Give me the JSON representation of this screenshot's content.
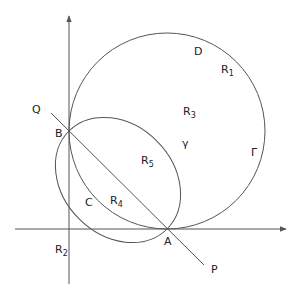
{
  "diagram": {
    "colors": {
      "stroke": "#555555",
      "text": "#222222",
      "background": "#ffffff"
    },
    "points": {
      "A": "A",
      "B": "B",
      "C": "C",
      "D": "D",
      "P": "P",
      "Q": "Q"
    },
    "curves": {
      "big_circle": "Γ",
      "inner_curve": "γ"
    },
    "regions": {
      "R1": {
        "base": "R",
        "sub": "1"
      },
      "R2": {
        "base": "R",
        "sub": "2"
      },
      "R3": {
        "base": "R",
        "sub": "3"
      },
      "R4": {
        "base": "R",
        "sub": "4"
      },
      "R5": {
        "base": "R",
        "sub": "5"
      }
    }
  }
}
